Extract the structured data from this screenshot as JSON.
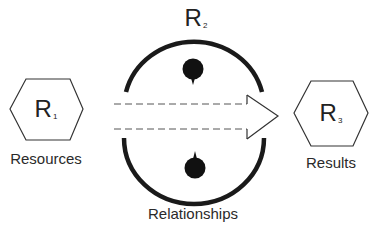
{
  "diagram": {
    "nodes": [
      {
        "id": "R1",
        "symbol": "R",
        "subscript": "1",
        "label": "Resources",
        "shape": "hexagon"
      },
      {
        "id": "R2",
        "symbol": "R",
        "subscript": "2",
        "label": "Relationships",
        "shape": "circle-with-gaps"
      },
      {
        "id": "R3",
        "symbol": "R",
        "subscript": "3",
        "label": "Results",
        "shape": "hexagon"
      }
    ],
    "edges": [
      {
        "from": "R1",
        "to": "R3",
        "style": "dashed-outline-arrow",
        "through": "R2"
      }
    ],
    "colors": {
      "stroke": "#222222",
      "fill": "#ffffff"
    }
  }
}
